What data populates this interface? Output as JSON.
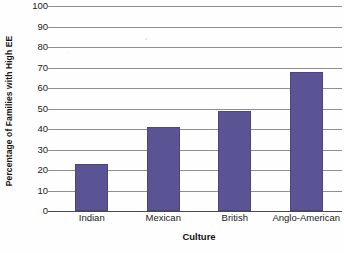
{
  "chart_data": {
    "type": "bar",
    "title": "",
    "xlabel": "Culture",
    "ylabel": "Percentage of Families with High EE",
    "categories": [
      "Indian",
      "Mexican",
      "British",
      "Anglo-American"
    ],
    "values": [
      23,
      41,
      49,
      68
    ],
    "series": [
      {
        "name": "Percentage of Families with High EE",
        "values": [
          23,
          41,
          49,
          68
        ]
      }
    ],
    "ylim": [
      0,
      100
    ],
    "yticks": [
      0,
      10,
      20,
      30,
      40,
      50,
      60,
      70,
      80,
      90,
      100
    ],
    "ytick_labels": [
      "0",
      "10",
      "20",
      "30",
      "40",
      "50",
      "60",
      "70",
      "80",
      "90",
      "100"
    ],
    "grid": true,
    "grid_axis": "y",
    "legend": false,
    "legend_position": "none",
    "bar_color": "#5a5494",
    "grid_color": "#8f8f8f",
    "axis_color": "#4a4a4a",
    "background_color": "#fefefe"
  },
  "axes": {
    "y_title": "Percentage of Families with High EE",
    "x_title": "Culture"
  }
}
